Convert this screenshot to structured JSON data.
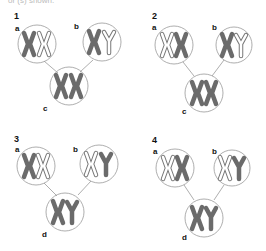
{
  "header": {
    "cut_text": "or (s) shown."
  },
  "colors": {
    "chromosome_dark": "#6b6b6b",
    "chromosome_outline": "#777777",
    "circle": "#999999",
    "text": "#111111"
  },
  "panels": [
    {
      "number": "1",
      "cells": [
        {
          "label": "a",
          "chromosomes": [
            "X-dark",
            "X-outline"
          ]
        },
        {
          "label": "b",
          "chromosomes": [
            "X-dark",
            "Y-outline"
          ]
        },
        {
          "label": "c",
          "chromosomes": [
            "X-dark",
            "X-dark"
          ]
        }
      ]
    },
    {
      "number": "2",
      "cells": [
        {
          "label": "a",
          "chromosomes": [
            "X-outline",
            "X-dark"
          ]
        },
        {
          "label": "b",
          "chromosomes": [
            "X-dark",
            "Y-outline"
          ]
        },
        {
          "label": "c",
          "chromosomes": [
            "X-dark",
            "X-dark"
          ]
        }
      ]
    },
    {
      "number": "3",
      "cells": [
        {
          "label": "a",
          "chromosomes": [
            "X-dark",
            "X-outline"
          ]
        },
        {
          "label": "b",
          "chromosomes": [
            "X-outline",
            "Y-dark"
          ]
        },
        {
          "label": "d",
          "chromosomes": [
            "X-dark",
            "Y-dark"
          ]
        }
      ]
    },
    {
      "number": "4",
      "cells": [
        {
          "label": "a",
          "chromosomes": [
            "X-outline",
            "X-dark"
          ]
        },
        {
          "label": "b",
          "chromosomes": [
            "X-outline",
            "Y-dark"
          ]
        },
        {
          "label": "d",
          "chromosomes": [
            "X-dark",
            "Y-dark"
          ]
        }
      ]
    }
  ]
}
